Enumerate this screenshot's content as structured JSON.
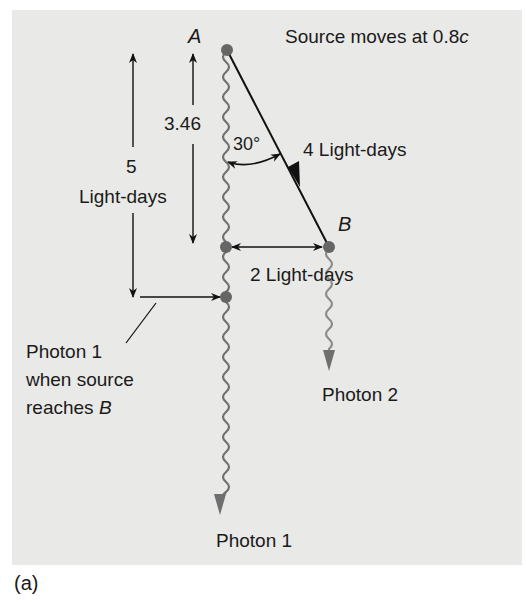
{
  "figure": {
    "caption": "(a)",
    "background_color": "#e9e9e7",
    "wave_color": "#6f6f6f",
    "dot_color": "#666666",
    "line_color": "#111111"
  },
  "labels": {
    "point_a": "A",
    "point_b": "B",
    "source_speed_prefix": "Source moves at 0.8",
    "source_speed_c": "c",
    "distance_346": "3.46",
    "distance_5_value": "5",
    "distance_5_unit": "Light-days",
    "angle": "30°",
    "path_ab": "4 Light-days",
    "horizontal_distance": "2 Light-days",
    "photon1_note_line1": "Photon 1",
    "photon1_note_line2": "when source",
    "photon1_note_line3_prefix": "reaches ",
    "photon1_note_line3_b": "B",
    "photon1": "Photon 1",
    "photon2": "Photon 2"
  },
  "geometry": {
    "point_a": [
      227,
      50
    ],
    "point_b": [
      329,
      247
    ],
    "photon1_at_b_time": [
      226,
      247
    ],
    "photon1_marker": [
      226,
      297
    ],
    "angle_deg": 30,
    "distances_light_days": {
      "AB": 4,
      "vertical_to_B": 3.46,
      "horizontal_to_B": 2,
      "photon1_travel": 5
    }
  }
}
